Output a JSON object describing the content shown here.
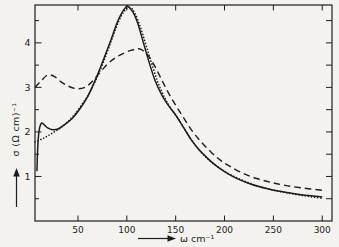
{
  "figure": {
    "paper_color": "#f3f2ee",
    "ink_color": "#1d1d1d"
  },
  "chart_data": {
    "type": "line",
    "title": "",
    "xlabel": "ω cm⁻¹",
    "ylabel": "σ (Ω cm)⁻¹",
    "xlim": [
      6,
      310
    ],
    "ylim": [
      0,
      4.85
    ],
    "x_ticks": [
      50,
      100,
      150,
      200,
      250,
      300
    ],
    "y_ticks_major": [
      1,
      2,
      3,
      4
    ],
    "y_ticks_minor": [
      0.5,
      1.5,
      2.5,
      3.5,
      4.5
    ],
    "right_axis_ticks": [
      0.5,
      1,
      1.5,
      2,
      2.5,
      3,
      3.5,
      4,
      4.5
    ],
    "grid": false,
    "legend_position": "none",
    "series": [
      {
        "name": "solid-curve",
        "style": "solid",
        "points": [
          [
            8,
            1.12
          ],
          [
            8.6,
            1.55
          ],
          [
            9.6,
            1.92
          ],
          [
            11,
            2.12
          ],
          [
            13,
            2.2
          ],
          [
            15.5,
            2.16
          ],
          [
            19,
            2.09
          ],
          [
            24,
            2.05
          ],
          [
            30,
            2.07
          ],
          [
            36,
            2.16
          ],
          [
            44,
            2.3
          ],
          [
            52,
            2.52
          ],
          [
            60,
            2.8
          ],
          [
            68,
            3.18
          ],
          [
            76,
            3.62
          ],
          [
            84,
            4.08
          ],
          [
            90,
            4.45
          ],
          [
            95,
            4.68
          ],
          [
            99,
            4.8
          ],
          [
            101,
            4.82
          ],
          [
            106,
            4.7
          ],
          [
            111,
            4.45
          ],
          [
            117,
            4.0
          ],
          [
            123,
            3.55
          ],
          [
            129,
            3.15
          ],
          [
            136,
            2.82
          ],
          [
            143,
            2.58
          ],
          [
            150,
            2.38
          ],
          [
            158,
            2.1
          ],
          [
            166,
            1.82
          ],
          [
            174,
            1.6
          ],
          [
            183,
            1.4
          ],
          [
            192,
            1.23
          ],
          [
            202,
            1.08
          ],
          [
            214,
            0.94
          ],
          [
            228,
            0.82
          ],
          [
            243,
            0.73
          ],
          [
            258,
            0.66
          ],
          [
            275,
            0.6
          ],
          [
            300,
            0.54
          ]
        ]
      },
      {
        "name": "dashed-curve",
        "style": "dashed",
        "points": [
          [
            6,
            3.0
          ],
          [
            12,
            3.14
          ],
          [
            19,
            3.28
          ],
          [
            26,
            3.24
          ],
          [
            33,
            3.12
          ],
          [
            41,
            3.02
          ],
          [
            49,
            2.97
          ],
          [
            57,
            3.0
          ],
          [
            64,
            3.12
          ],
          [
            72,
            3.32
          ],
          [
            80,
            3.52
          ],
          [
            88,
            3.66
          ],
          [
            96,
            3.76
          ],
          [
            104,
            3.83
          ],
          [
            110,
            3.86
          ],
          [
            114,
            3.86
          ],
          [
            121,
            3.74
          ],
          [
            128,
            3.5
          ],
          [
            135,
            3.2
          ],
          [
            142,
            2.9
          ],
          [
            150,
            2.6
          ],
          [
            158,
            2.32
          ],
          [
            167,
            2.02
          ],
          [
            176,
            1.78
          ],
          [
            186,
            1.55
          ],
          [
            196,
            1.36
          ],
          [
            206,
            1.22
          ],
          [
            218,
            1.08
          ],
          [
            232,
            0.96
          ],
          [
            247,
            0.87
          ],
          [
            262,
            0.8
          ],
          [
            280,
            0.74
          ],
          [
            300,
            0.69
          ]
        ]
      },
      {
        "name": "dotted-curve",
        "style": "dotted",
        "points": [
          [
            6,
            1.78
          ],
          [
            14,
            1.85
          ],
          [
            22,
            1.95
          ],
          [
            30,
            2.06
          ],
          [
            38,
            2.2
          ],
          [
            46,
            2.38
          ],
          [
            54,
            2.62
          ],
          [
            62,
            2.88
          ],
          [
            70,
            3.25
          ],
          [
            78,
            3.68
          ],
          [
            85,
            4.1
          ],
          [
            92,
            4.5
          ],
          [
            98,
            4.73
          ],
          [
            103,
            4.8
          ],
          [
            108,
            4.68
          ],
          [
            114,
            4.35
          ],
          [
            120,
            3.92
          ],
          [
            126,
            3.5
          ],
          [
            132,
            3.1
          ],
          [
            139,
            2.76
          ],
          [
            146,
            2.5
          ],
          [
            153,
            2.28
          ],
          [
            161,
            2.0
          ],
          [
            169,
            1.73
          ],
          [
            177,
            1.52
          ],
          [
            186,
            1.33
          ],
          [
            196,
            1.17
          ],
          [
            206,
            1.04
          ],
          [
            218,
            0.92
          ],
          [
            232,
            0.8
          ],
          [
            247,
            0.71
          ],
          [
            262,
            0.64
          ],
          [
            280,
            0.57
          ],
          [
            300,
            0.51
          ]
        ]
      }
    ]
  }
}
